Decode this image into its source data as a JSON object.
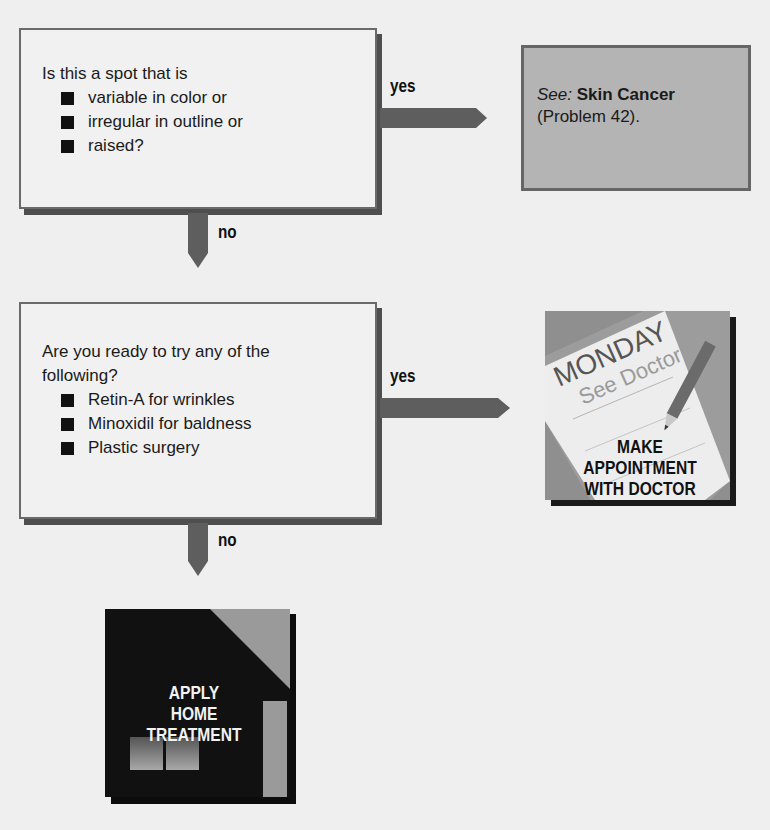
{
  "flowchart": {
    "question1": {
      "prompt": "Is this a spot that is",
      "items": [
        "variable in color or",
        "irregular in outline or",
        "raised?"
      ],
      "yes_label": "yes",
      "no_label": "no"
    },
    "outcome_yes1": {
      "see_prefix": "See:",
      "topic": "Skin Cancer",
      "reference": "(Problem 42)."
    },
    "question2": {
      "prompt_line1": "Are you ready to try any of the",
      "prompt_line2": "following?",
      "items": [
        "Retin-A for wrinkles",
        "Minoxidil for baldness",
        "Plastic surgery"
      ],
      "yes_label": "yes",
      "no_label": "no"
    },
    "outcome_yes2": {
      "note_day": "MONDAY",
      "note_text": "See Doctor",
      "caption_lines": [
        "MAKE",
        "APPOINTMENT",
        "WITH DOCTOR"
      ]
    },
    "outcome_no2": {
      "caption_lines": [
        "APPLY",
        "HOME",
        "TREATMENT"
      ]
    }
  },
  "colors": {
    "background": "#efefef",
    "box_fill": "#f1f1f1",
    "box_border": "#6a6a6a",
    "connector": "#5e5e5e",
    "reference_fill": "#b4b4b4",
    "home_dark": "#111111",
    "home_roof": "#9a9a9a"
  }
}
